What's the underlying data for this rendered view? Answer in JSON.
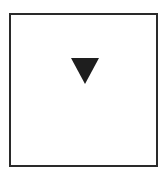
{
  "panel": {
    "border_color": "#2a2a2a",
    "background": "#ffffff"
  },
  "indicator": {
    "icon": "triangle-down-icon",
    "color": "#1e1e1e"
  }
}
